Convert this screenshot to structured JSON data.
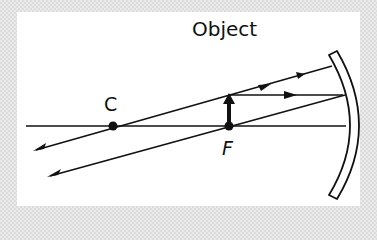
{
  "diagram": {
    "title": "Object",
    "points": {
      "center_of_curvature": "C",
      "focal_point": "F"
    },
    "elements": [
      "principal-axis",
      "concave-mirror",
      "object-arrow",
      "ray-parallel-reflected-through-F",
      "ray-through-C-reflected-back"
    ],
    "colors": {
      "line": "#111111",
      "background": "#ffffff",
      "border": "#e9e9e9"
    }
  }
}
